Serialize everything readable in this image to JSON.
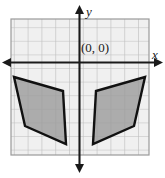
{
  "figure": {
    "kind": "coordinate-plane-diagram",
    "labels": {
      "origin": "(0, 0)",
      "y_axis": "y",
      "x_axis": "x"
    },
    "colors": {
      "background": "#ffffff",
      "grid_fill": "#f0f0f0",
      "grid_line": "#b8b8b8",
      "grid_border": "#9a9a9a",
      "axis": "#1a1a1a",
      "shape_fill": "#9c9c9c",
      "shape_stroke": "#111111"
    },
    "grid": {
      "left": 11,
      "top": 19,
      "right": 149,
      "bottom": 155,
      "cell_size": 13.8,
      "columns": 10,
      "rows": 10,
      "show_grid": true
    },
    "axes": {
      "x_axis_y": 62.5,
      "y_axis_x": 79.5,
      "x_start": 3,
      "x_end": 162,
      "y_start": 6,
      "y_end": 172,
      "arrows": [
        "left",
        "right",
        "up",
        "down"
      ]
    },
    "shapes": [
      {
        "name": "left-quadrilateral",
        "points": "14,77 63,91 66,144 25,126",
        "vertices_px": [
          [
            14,
            77
          ],
          [
            63,
            91
          ],
          [
            66,
            144
          ],
          [
            25,
            126
          ]
        ]
      },
      {
        "name": "right-quadrilateral",
        "points": "145,77 134,126 93,144 96,91",
        "vertices_px": [
          [
            145,
            77
          ],
          [
            134,
            126
          ],
          [
            93,
            144
          ],
          [
            96,
            91
          ]
        ]
      }
    ]
  }
}
